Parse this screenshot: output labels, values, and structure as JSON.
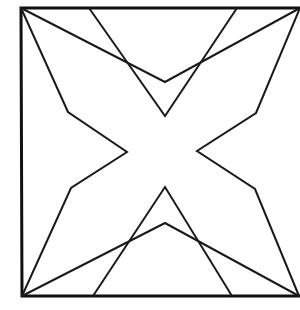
{
  "diagram": {
    "title": "",
    "stroke_color": "#111111",
    "background": "#ffffff",
    "frame": {
      "top_left": [
        21,
        8
      ],
      "top_right": [
        300,
        8
      ],
      "bottom_right": [
        299,
        296
      ],
      "bottom_left": [
        22,
        296
      ],
      "edges_drawn": [
        "top",
        "left",
        "bottom"
      ]
    },
    "polylines": [
      {
        "name": "left-arm-polyline",
        "points": "21,8 68,112 127,152 71,188 22,296"
      },
      {
        "name": "right-arm-polyline",
        "points": "300,8 256,113 197,151 255,189 299,296"
      },
      {
        "name": "top-deep-v",
        "points": "89,8 165,116 237,8"
      },
      {
        "name": "top-shallow-v",
        "points": "21,8 165,82 300,8"
      },
      {
        "name": "bottom-deep-lambda",
        "points": "93,296 165,187 232,296"
      },
      {
        "name": "bottom-shallow-lambda",
        "points": "22,296 165,223 299,296"
      }
    ]
  }
}
